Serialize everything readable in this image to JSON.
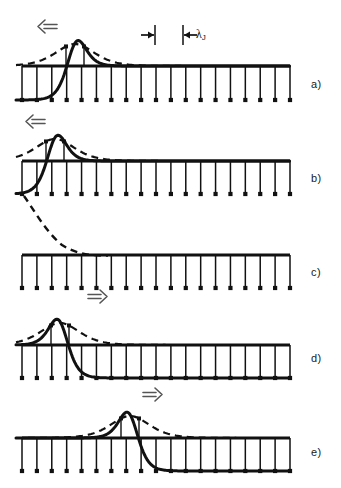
{
  "figure": {
    "background_color": "#ffffff",
    "ink_color": "#111111",
    "width": 341,
    "height": 488
  },
  "annotations": {
    "lambda_symbol": "λ",
    "lambda_subscript": "J",
    "lambda_full": "λJ",
    "arrow_left": "⇐",
    "arrow_right": "⇒"
  },
  "panels": [
    {
      "id": "a",
      "label": "a)",
      "label_x": 311,
      "label_y": 78,
      "direction": "left",
      "arrow_glyph": "⇐",
      "arrow_x": 38,
      "arrow_y": 21,
      "has_solid_pulse": true,
      "has_dashed_envelope": true,
      "pulse_center_x": 75,
      "rail_y": 66,
      "base_y": 100,
      "rung_count": 19,
      "lattice_x0": 22,
      "lattice_x1": 290
    },
    {
      "id": "b",
      "label": "b)",
      "label_x": 311,
      "label_y": 172,
      "direction": "left",
      "arrow_glyph": "⇐",
      "arrow_x": 26,
      "arrow_y": 116,
      "has_solid_pulse": true,
      "has_dashed_envelope": true,
      "pulse_center_x": 55,
      "rail_y": 161,
      "base_y": 194,
      "rung_count": 19,
      "lattice_x0": 22,
      "lattice_x1": 290
    },
    {
      "id": "c",
      "label": "c)",
      "label_x": 311,
      "label_y": 266,
      "direction": "none",
      "arrow_glyph": "",
      "has_solid_pulse": false,
      "has_dashed_envelope": true,
      "pulse_center_x": 22,
      "rail_y": 255,
      "base_y": 288,
      "rung_count": 19,
      "lattice_x0": 22,
      "lattice_x1": 290
    },
    {
      "id": "d",
      "label": "d)",
      "label_x": 311,
      "label_y": 352,
      "direction": "right",
      "arrow_glyph": "⇒",
      "arrow_x": 88,
      "arrow_y": 291,
      "has_solid_pulse": true,
      "has_dashed_envelope": true,
      "pulse_center_x": 60,
      "rail_y": 345,
      "base_y": 378,
      "rung_count": 19,
      "lattice_x0": 22,
      "lattice_x1": 290
    },
    {
      "id": "e",
      "label": "e)",
      "label_x": 311,
      "label_y": 446,
      "direction": "right",
      "arrow_glyph": "⇒",
      "arrow_x": 143,
      "arrow_y": 389,
      "has_solid_pulse": true,
      "has_dashed_envelope": true,
      "pulse_center_x": 130,
      "rail_y": 438,
      "base_y": 471,
      "rung_count": 19,
      "lattice_x0": 22,
      "lattice_x1": 290
    }
  ],
  "scale_marker": {
    "name": "josephson-penetration-depth",
    "label": "λJ",
    "tick_left_x": 155,
    "tick_right_x": 183,
    "tick_top_y": 25,
    "tick_bottom_y": 45,
    "label_x": 196,
    "label_y": 27
  }
}
